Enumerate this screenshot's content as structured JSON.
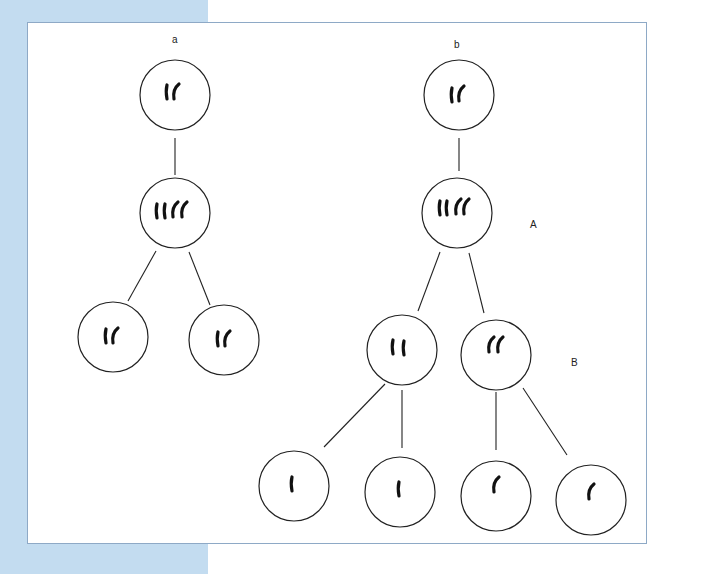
{
  "figure": {
    "background_band_color": "#c3dcf0",
    "frame_border_color": "#8ea9c6",
    "panels": [
      {
        "id": "a",
        "label": "a",
        "description": "Mitosis: one cell with 2 chromosomes replicates to 4, divides into two cells with 2 chromosomes each"
      },
      {
        "id": "b",
        "label": "b",
        "description": "Meiosis: one cell with 2 chromosomes replicates to 4, two divisions yield four cells with 1 chromosome each"
      }
    ],
    "stage_labels": {
      "A": "A",
      "B": "B"
    },
    "cells": [
      {
        "panel": "a",
        "level": 1,
        "chromosomes": 2
      },
      {
        "panel": "a",
        "level": 2,
        "chromosomes": 4
      },
      {
        "panel": "a",
        "level": 3,
        "chromosomes": 2
      },
      {
        "panel": "a",
        "level": 3,
        "chromosomes": 2
      },
      {
        "panel": "b",
        "level": 1,
        "chromosomes": 2
      },
      {
        "panel": "b",
        "level": 2,
        "chromosomes": 4
      },
      {
        "panel": "b",
        "level": 3,
        "chromosomes": 2
      },
      {
        "panel": "b",
        "level": 3,
        "chromosomes": 2
      },
      {
        "panel": "b",
        "level": 4,
        "chromosomes": 1
      },
      {
        "panel": "b",
        "level": 4,
        "chromosomes": 1
      },
      {
        "panel": "b",
        "level": 4,
        "chromosomes": 1
      },
      {
        "panel": "b",
        "level": 4,
        "chromosomes": 1
      }
    ]
  }
}
